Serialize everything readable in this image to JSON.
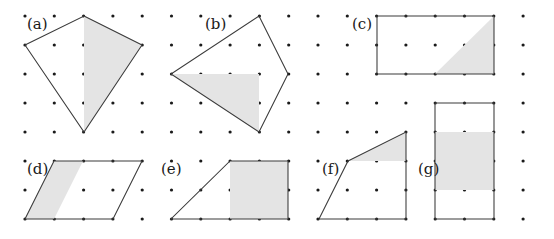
{
  "figure": {
    "background_color": "#ffffff",
    "outline_color": "#3a3a3a",
    "shade_color": "#e4e4e4",
    "dot_color": "#1a1a1a",
    "grid": {
      "origin_x": 25,
      "origin_y": 16,
      "spacing_x": 29.3,
      "spacing_y": 29.0,
      "cols": 19,
      "rows": 8,
      "dot_radius": 1.6
    },
    "panels": [
      {
        "id": "a",
        "label": "(a)",
        "label_x": 27,
        "label_y": 29,
        "shape_name": "kite",
        "outline_points": "84,16 142,45 84,132 25,45",
        "shaded_points": "84,16 142,45 84,132",
        "shaded_description": "right half of the kite"
      },
      {
        "id": "b",
        "label": "(b)",
        "label_x": 205,
        "label_y": 29,
        "shape_name": "rhombus",
        "outline_points": "259,16 288,74 259,132 171,74",
        "shaded_points": "171,74 259,74 259,132",
        "shaded_description": "lower-left triangle inside the rhombus"
      },
      {
        "id": "c",
        "label": "(c)",
        "label_x": 352,
        "label_y": 29,
        "shape_name": "rectangle",
        "outline_points": "377,16 494,16 494,74 377,74",
        "shaded_points": "435,74 494,16 494,74",
        "shaded_description": "lower-right triangle inside the rectangle"
      },
      {
        "id": "d",
        "label": "(d)",
        "label_x": 27,
        "label_y": 174,
        "shape_name": "parallelogram",
        "outline_points": "54,161 142,161 113,219 25,219"
      },
      {
        "id": "e",
        "label": "(e)",
        "label_x": 161,
        "label_y": 174,
        "shape_name": "trapezoid",
        "outline_points": "230,161 288,161 288,219 171,219"
      },
      {
        "id": "f",
        "label": "(f)",
        "label_x": 322,
        "label_y": 174,
        "shape_name": "quadrilateral",
        "outline_points": "348,161 406,132 406,219 319,219"
      },
      {
        "id": "g",
        "label": "(g)",
        "label_x": 418,
        "label_y": 174,
        "shape_name": "rectangle",
        "outline_points": "435,103 494,103 494,219 435,219",
        "shaded_points": "435,132 494,132 494,190 435,190",
        "shaded_description": "horizontal middle band of the rectangle"
      }
    ],
    "shaded_regions_extra": [
      {
        "panel": "d",
        "points": "54,161 83,161 54,219 25,219",
        "shaded_description": "left slanted strip of the parallelogram"
      },
      {
        "panel": "e",
        "points": "230,161 288,161 288,219 230,219",
        "shaded_description": "right square of the trapezoid"
      },
      {
        "panel": "f",
        "points": "348,161 406,132 406,161",
        "shaded_description": "top triangle of the quadrilateral"
      }
    ]
  }
}
